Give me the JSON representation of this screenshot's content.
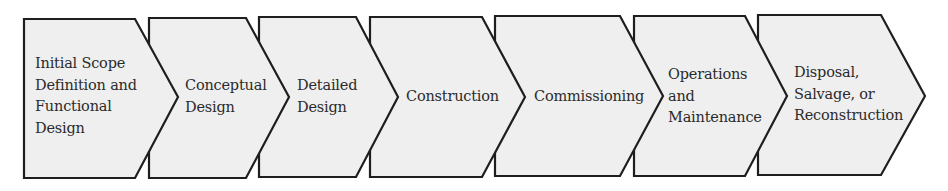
{
  "diagram": {
    "type": "process-chevron-flow",
    "colors": {
      "fill": "#efefef",
      "stroke": "#1e1e1e",
      "text": "#2b2b2b",
      "background": "#ffffff"
    },
    "stages": [
      {
        "label": "Initial Scope Definition and Functional Design",
        "lines": [
          "Initial Scope",
          "Definition and",
          "Functional",
          "Design"
        ]
      },
      {
        "label": "Conceptual Design",
        "lines": [
          "Conceptual",
          "Design"
        ]
      },
      {
        "label": "Detailed Design",
        "lines": [
          "Detailed",
          "Design"
        ]
      },
      {
        "label": "Construction",
        "lines": [
          "Construction"
        ]
      },
      {
        "label": "Commissioning",
        "lines": [
          "Commissioning"
        ]
      },
      {
        "label": "Operations and Maintenance",
        "lines": [
          "Operations",
          "and",
          "Maintenance"
        ]
      },
      {
        "label": "Disposal, Salvage, or Reconstruction",
        "lines": [
          "Disposal,",
          "Salvage, or",
          "Reconstruction"
        ]
      }
    ]
  }
}
